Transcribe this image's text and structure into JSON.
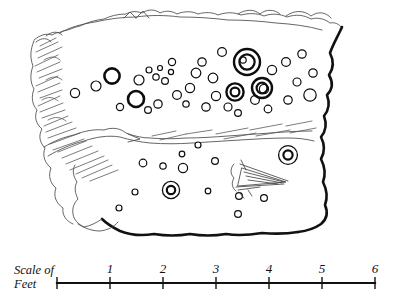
{
  "figure": {
    "ink_color": "#0d0d0d",
    "paper_color": "#ffffff",
    "shading_color": "#5a5a5a"
  },
  "scale": {
    "caption_line1": "Scale of",
    "caption_line2": "Feet",
    "unit": "Feet",
    "ticks": [
      {
        "label": "",
        "value": 0,
        "x": 57
      },
      {
        "label": "1",
        "value": 1,
        "x": 110
      },
      {
        "label": "2",
        "value": 2,
        "x": 163
      },
      {
        "label": "3",
        "value": 3,
        "x": 216
      },
      {
        "label": "4",
        "value": 4,
        "x": 269
      },
      {
        "label": "5",
        "value": 5,
        "x": 322
      },
      {
        "label": "6",
        "value": 6,
        "x": 375
      }
    ],
    "axis": {
      "x1": 57,
      "x2": 375,
      "y": 283
    }
  },
  "panel": {
    "outline_note": "irregular rock slab, heavy ink on right and lower margins, faint broken line on upper and left margins",
    "divider_note": "horizontal fissure crossing the slab separating upper and lower fields",
    "hatching_note": "oblique shading strokes along the left margin and along the fissure"
  },
  "marks": {
    "legend": {
      "cup": "cup mark",
      "cup_bold": "deep cup mark",
      "cup_and_ring": "cup-and-ring mark",
      "groove": "radial groove / channel"
    },
    "counts": {
      "cups_upper": 36,
      "cups_lower": 12,
      "cup_and_rings": 5,
      "deep_cups": 4
    },
    "upper_field_cups": [
      {
        "cx": 96,
        "cy": 86,
        "r": 5.0,
        "weight": "light"
      },
      {
        "cx": 75,
        "cy": 93,
        "r": 4.6,
        "weight": "light"
      },
      {
        "cx": 112,
        "cy": 76,
        "r": 7.6,
        "weight": "bold"
      },
      {
        "cx": 136,
        "cy": 99,
        "r": 8.0,
        "weight": "bold"
      },
      {
        "cx": 139,
        "cy": 80,
        "r": 5.0,
        "weight": "light"
      },
      {
        "cx": 120,
        "cy": 107,
        "r": 3.6,
        "weight": "light"
      },
      {
        "cx": 149,
        "cy": 70,
        "r": 3.0,
        "weight": "light"
      },
      {
        "cx": 156,
        "cy": 77,
        "r": 3.2,
        "weight": "light"
      },
      {
        "cx": 160,
        "cy": 68,
        "r": 2.5,
        "weight": "light"
      },
      {
        "cx": 165,
        "cy": 81,
        "r": 3.4,
        "weight": "light"
      },
      {
        "cx": 171,
        "cy": 72,
        "r": 2.6,
        "weight": "light"
      },
      {
        "cx": 172,
        "cy": 62,
        "r": 3.6,
        "weight": "light"
      },
      {
        "cx": 158,
        "cy": 104,
        "r": 4.2,
        "weight": "light"
      },
      {
        "cx": 148,
        "cy": 110,
        "r": 3.4,
        "weight": "light"
      },
      {
        "cx": 177,
        "cy": 95,
        "r": 4.4,
        "weight": "light"
      },
      {
        "cx": 186,
        "cy": 104,
        "r": 3.2,
        "weight": "light"
      },
      {
        "cx": 190,
        "cy": 88,
        "r": 4.6,
        "weight": "light"
      },
      {
        "cx": 196,
        "cy": 73,
        "r": 4.8,
        "weight": "light"
      },
      {
        "cx": 202,
        "cy": 62,
        "r": 4.2,
        "weight": "light"
      },
      {
        "cx": 213,
        "cy": 78,
        "r": 4.8,
        "weight": "light"
      },
      {
        "cx": 216,
        "cy": 96,
        "r": 4.6,
        "weight": "light"
      },
      {
        "cx": 206,
        "cy": 107,
        "r": 4.2,
        "weight": "light"
      },
      {
        "cx": 222,
        "cy": 52,
        "r": 4.4,
        "weight": "light"
      },
      {
        "cx": 228,
        "cy": 107,
        "r": 4.0,
        "weight": "light"
      },
      {
        "cx": 238,
        "cy": 113,
        "r": 3.4,
        "weight": "light"
      },
      {
        "cx": 243,
        "cy": 60,
        "r": 3.2,
        "weight": "light"
      },
      {
        "cx": 255,
        "cy": 100,
        "r": 4.4,
        "weight": "light"
      },
      {
        "cx": 268,
        "cy": 109,
        "r": 3.8,
        "weight": "light"
      },
      {
        "cx": 264,
        "cy": 89,
        "r": 4.6,
        "weight": "light"
      },
      {
        "cx": 272,
        "cy": 70,
        "r": 4.6,
        "weight": "light"
      },
      {
        "cx": 286,
        "cy": 62,
        "r": 4.4,
        "weight": "light"
      },
      {
        "cx": 288,
        "cy": 100,
        "r": 4.2,
        "weight": "light"
      },
      {
        "cx": 297,
        "cy": 82,
        "r": 4.0,
        "weight": "light"
      },
      {
        "cx": 302,
        "cy": 54,
        "r": 4.2,
        "weight": "light"
      },
      {
        "cx": 310,
        "cy": 95,
        "r": 6.2,
        "weight": "light"
      },
      {
        "cx": 313,
        "cy": 73,
        "r": 4.2,
        "weight": "light"
      }
    ],
    "upper_field_rings": [
      {
        "cx": 247,
        "cy": 62,
        "r_outer": 13.0,
        "r_inner": 7.6
      },
      {
        "cx": 262,
        "cy": 88,
        "r_outer": 10.0,
        "r_inner": 5.4
      },
      {
        "cx": 235,
        "cy": 92,
        "r_outer": 8.6,
        "r_inner": 4.4
      }
    ],
    "lower_field_cups": [
      {
        "cx": 143,
        "cy": 163,
        "r": 3.8,
        "weight": "light"
      },
      {
        "cx": 163,
        "cy": 166,
        "r": 3.2,
        "weight": "light"
      },
      {
        "cx": 182,
        "cy": 154,
        "r": 2.8,
        "weight": "light"
      },
      {
        "cx": 183,
        "cy": 168,
        "r": 4.6,
        "weight": "light"
      },
      {
        "cx": 198,
        "cy": 145,
        "r": 3.0,
        "weight": "light"
      },
      {
        "cx": 208,
        "cy": 191,
        "r": 2.8,
        "weight": "light"
      },
      {
        "cx": 215,
        "cy": 161,
        "r": 3.4,
        "weight": "light"
      },
      {
        "cx": 238,
        "cy": 214,
        "r": 3.4,
        "weight": "light"
      },
      {
        "cx": 239,
        "cy": 196,
        "r": 3.4,
        "weight": "light"
      },
      {
        "cx": 264,
        "cy": 198,
        "r": 3.4,
        "weight": "light"
      },
      {
        "cx": 119,
        "cy": 208,
        "r": 3.0,
        "weight": "light"
      },
      {
        "cx": 135,
        "cy": 192,
        "r": 3.0,
        "weight": "light"
      }
    ],
    "lower_field_rings": [
      {
        "cx": 171,
        "cy": 190,
        "r_outer": 8.6,
        "r_inner": 4.2
      },
      {
        "cx": 288,
        "cy": 155,
        "r_outer": 9.4,
        "r_inner": 4.6
      }
    ]
  }
}
